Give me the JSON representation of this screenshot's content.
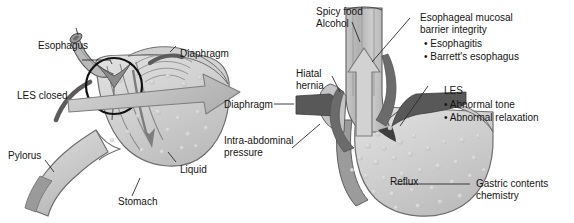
{
  "figure": {
    "type": "medical-diagram",
    "panels": [
      {
        "id": "left",
        "name": "normal-stomach-panel",
        "description": "Normal stomach with closed lower esophageal sphincter and liquid contents",
        "labels": [
          {
            "name": "esophagus",
            "text": "Esophagus"
          },
          {
            "name": "les-closed",
            "text": "LES closed"
          },
          {
            "name": "diaphragm",
            "text": "Diaphragm"
          },
          {
            "name": "pylorus",
            "text": "Pylorus"
          },
          {
            "name": "liquid",
            "text": "Liquid"
          },
          {
            "name": "stomach",
            "text": "Stomach"
          }
        ]
      },
      {
        "id": "right",
        "name": "reflux-panel",
        "description": "Gastroesophageal reflux with hiatal hernia and abnormal LES",
        "labels": [
          {
            "name": "spicy-food",
            "text": "Spicy food"
          },
          {
            "name": "alcohol",
            "text": "Alcohol"
          },
          {
            "name": "hiatal-hernia-line1",
            "text": "Hiatal"
          },
          {
            "name": "hiatal-hernia-line2",
            "text": "hernia"
          },
          {
            "name": "diaphragm",
            "text": "Diaphragm"
          },
          {
            "name": "intra-abdominal-line1",
            "text": "Intra-abdominal"
          },
          {
            "name": "intra-abdominal-line2",
            "text": "pressure"
          },
          {
            "name": "reflux",
            "text": "Reflux"
          }
        ],
        "callouts": [
          {
            "name": "esophageal-mucosal-barrier",
            "heading_line1": "Esophageal mucosal",
            "heading_line2": "barrier integrity",
            "bullets": [
              "• Esophagitis",
              "• Barrett's esophagus"
            ]
          },
          {
            "name": "les-abnormal",
            "heading_line1": "LES",
            "heading_line2": "",
            "bullets": [
              "• Abnormal tone",
              "• Abnormal relaxation"
            ]
          },
          {
            "name": "gastric-contents",
            "heading_line1": "Gastric contents",
            "heading_line2": "chemistry",
            "bullets": []
          }
        ]
      }
    ]
  },
  "colors": {
    "background": "#ffffff",
    "text": "#151515",
    "leader_line": "#2b2b2b",
    "organ_fill_light": "#d9d9d9",
    "organ_fill_mid": "#bfbfbf",
    "organ_fill_dark": "#8f8f8f",
    "muscle_dark": "#6e6e6e",
    "outline": "#5a5a5a",
    "arrow_fill": "#c9c9c9",
    "bubble": "#c4c4c4"
  }
}
